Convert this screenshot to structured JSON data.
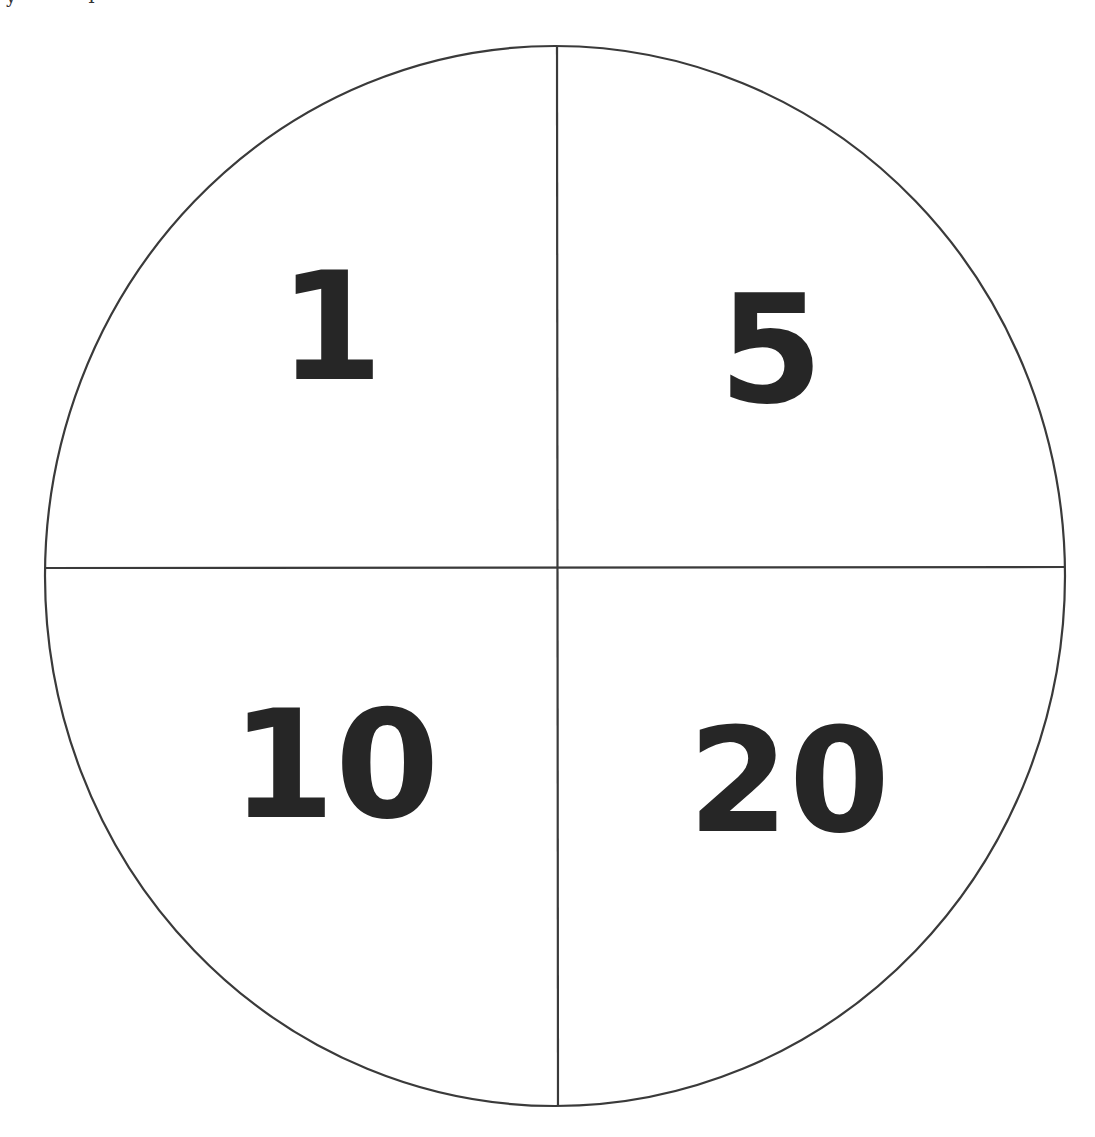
{
  "diagram": {
    "type": "spinner-circle-quadrants",
    "stroke_color": "#3a3a3a",
    "text_color": "#262626",
    "quadrants": [
      {
        "position": "top-left",
        "label": "1"
      },
      {
        "position": "top-right",
        "label": "5"
      },
      {
        "position": "bottom-left",
        "label": "10"
      },
      {
        "position": "bottom-right",
        "label": "20"
      }
    ]
  },
  "cropped_header": {
    "fragments": [
      "y",
      "I"
    ]
  }
}
